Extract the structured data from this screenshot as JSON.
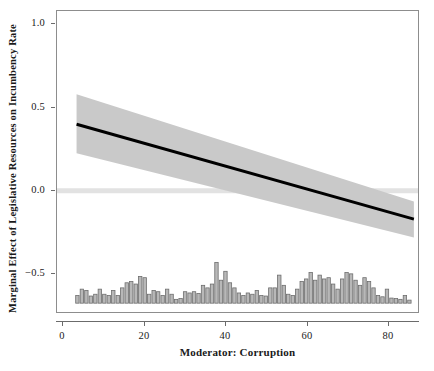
{
  "chart_data": {
    "type": "line",
    "title": "",
    "xlabel": "Moderator: Corruption",
    "ylabel": "Marginal Effect of Legislative Resources on Incumbency Rate",
    "xlim": [
      -1.5,
      87.5
    ],
    "ylim": [
      -0.74,
      1.08
    ],
    "grid": false,
    "legend": null,
    "xticks": [
      0,
      20,
      40,
      60,
      80
    ],
    "xtick_labels": [
      "0",
      "20",
      "40",
      "60",
      "80"
    ],
    "yticks": [
      1.0,
      0.5,
      0.0,
      -0.5
    ],
    "ytick_labels": [
      "1.0",
      "0.5",
      "0.0",
      "−0.5"
    ],
    "zero_reference_line": {
      "y": 0.0,
      "color": "#e2e2e2",
      "width_px": 5
    },
    "series": [
      {
        "name": "Marginal effect",
        "type": "line",
        "color": "#000000",
        "linewidth_px": 3,
        "x": [
          3.3,
          86.0
        ],
        "values": [
          0.4,
          -0.17
        ]
      },
      {
        "name": "95% confidence interval",
        "type": "band",
        "color": "#c9c9c9",
        "x": [
          3.3,
          86.0
        ],
        "upper": [
          0.58,
          -0.065
        ],
        "lower": [
          0.225,
          -0.28
        ]
      }
    ],
    "rug_histogram": {
      "type": "bar",
      "name": "Distribution of moderator",
      "color": "#b8b8b8",
      "edgecolor": "#6e6e6e",
      "baseline": -0.675,
      "max_top": -0.43,
      "bin_width": 1.1,
      "x": [
        3.5,
        4.6,
        5.7,
        6.8,
        7.9,
        9.0,
        10.1,
        11.2,
        12.3,
        13.4,
        14.5,
        15.6,
        16.7,
        17.8,
        18.9,
        20.0,
        21.1,
        22.2,
        23.3,
        24.4,
        25.5,
        26.6,
        27.7,
        28.8,
        29.9,
        31.0,
        32.1,
        33.2,
        34.3,
        35.4,
        36.5,
        37.6,
        38.7,
        39.8,
        40.9,
        42.0,
        43.1,
        44.2,
        45.3,
        46.4,
        47.5,
        48.6,
        49.7,
        50.8,
        51.9,
        53.0,
        54.1,
        55.2,
        56.3,
        57.4,
        58.5,
        59.6,
        60.7,
        61.8,
        62.9,
        64.0,
        65.1,
        66.2,
        67.3,
        68.4,
        69.5,
        70.6,
        71.7,
        72.8,
        73.9,
        75.0,
        76.1,
        77.2,
        78.3,
        79.4,
        80.5,
        81.6,
        82.7,
        83.8,
        84.9
      ],
      "counts": [
        0.03,
        0.055,
        0.05,
        0.028,
        0.035,
        0.055,
        0.035,
        0.03,
        0.05,
        0.03,
        0.06,
        0.08,
        0.085,
        0.075,
        0.105,
        0.1,
        0.035,
        0.05,
        0.045,
        0.03,
        0.055,
        0.035,
        0.015,
        0.018,
        0.045,
        0.04,
        0.045,
        0.038,
        0.07,
        0.06,
        0.075,
        0.16,
        0.09,
        0.125,
        0.08,
        0.06,
        0.04,
        0.03,
        0.04,
        0.035,
        0.05,
        0.03,
        0.028,
        0.06,
        0.06,
        0.11,
        0.07,
        0.035,
        0.03,
        0.055,
        0.085,
        0.095,
        0.12,
        0.09,
        0.11,
        0.095,
        0.1,
        0.075,
        0.055,
        0.095,
        0.12,
        0.115,
        0.09,
        0.07,
        0.1,
        0.085,
        0.06,
        0.03,
        0.025,
        0.055,
        0.02,
        0.018,
        0.015,
        0.03,
        0.012
      ]
    }
  }
}
